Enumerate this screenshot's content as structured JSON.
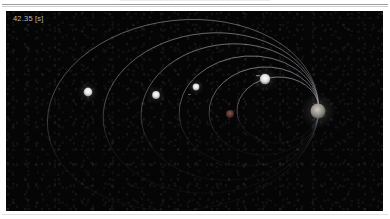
{
  "page": {
    "header_running_text": "———————————————————————————",
    "background_color": "#ffffff"
  },
  "viewport": {
    "background_color": "#050506",
    "width": 377,
    "height": 200
  },
  "hud": {
    "sim_time": "42.35 [s]",
    "sim_time_color": "#b9b9bd",
    "corner_label": "··· ·· ·········· ··· ··",
    "corner_label_color": "#55555c"
  },
  "chart_data": {
    "type": "scatter",
    "xlabel": "",
    "ylabel": "",
    "xlim": [
      0,
      377
    ],
    "ylim": [
      0,
      200
    ],
    "grid": false,
    "legend": "none",
    "focus": {
      "x": 312,
      "y": 100
    },
    "orbit_color_bright": "#c6c6cc",
    "orbit_color_dim": "#4a4a52",
    "orbits": [
      {
        "name": "orbit-1-outermost",
        "cx": 177,
        "cy": 104,
        "rx": 136,
        "ry": 95,
        "rotation": -6,
        "brightness": 0.72
      },
      {
        "name": "orbit-2",
        "cx": 205,
        "cy": 102,
        "rx": 108,
        "ry": 80,
        "rotation": -5,
        "brightness": 0.8
      },
      {
        "name": "orbit-3",
        "cx": 224,
        "cy": 101,
        "rx": 89,
        "ry": 68,
        "rotation": -5,
        "brightness": 0.84
      },
      {
        "name": "orbit-4",
        "cx": 243,
        "cy": 100,
        "rx": 70,
        "ry": 55,
        "rotation": -4,
        "brightness": 0.88
      },
      {
        "name": "orbit-5",
        "cx": 258,
        "cy": 100,
        "rx": 55,
        "ry": 44,
        "rotation": -4,
        "brightness": 0.9
      },
      {
        "name": "orbit-6-innermost",
        "cx": 272,
        "cy": 99,
        "rx": 41,
        "ry": 33,
        "rotation": -3,
        "brightness": 0.92
      }
    ],
    "bodies": [
      {
        "name": "central-star",
        "x": 312,
        "y": 100,
        "r": 7.5,
        "color": "#9a968f",
        "glow": true,
        "label": "central body"
      },
      {
        "name": "planet-outer-1",
        "x": 82,
        "y": 81,
        "r": 4.4,
        "color": "#f2f2f2",
        "glow": true,
        "label": "planet 1"
      },
      {
        "name": "planet-outer-2",
        "x": 150,
        "y": 84,
        "r": 3.9,
        "color": "#ededed",
        "glow": true,
        "label": "planet 2"
      },
      {
        "name": "planet-mid",
        "x": 190,
        "y": 76,
        "r": 3.4,
        "color": "#c9c9c9",
        "glow": true,
        "label": "planet 3"
      },
      {
        "name": "planet-bright",
        "x": 259,
        "y": 68,
        "r": 5.2,
        "color": "#fbfbfb",
        "glow": true,
        "label": "planet 4"
      },
      {
        "name": "planet-inner",
        "x": 224,
        "y": 103,
        "r": 4.0,
        "color": "#6a4038",
        "glow": false,
        "label": "planet 5"
      }
    ],
    "markers": [
      {
        "name": "trail-marker-1",
        "x": 250,
        "y": 64,
        "w": 4,
        "h": 1.2,
        "color": "#8f8f96"
      },
      {
        "name": "trail-marker-2",
        "x": 182,
        "y": 83,
        "w": 3,
        "h": 1.0,
        "color": "#7a7a82"
      }
    ]
  }
}
